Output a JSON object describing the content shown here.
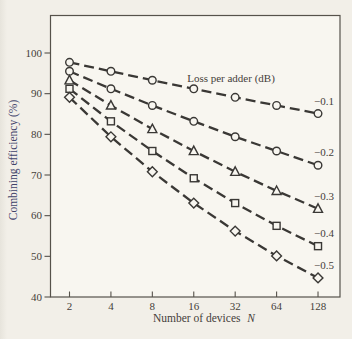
{
  "figure": {
    "bg_color": "#f2efe8",
    "plot_bg_color": "#f8f6f0",
    "axis_color": "#56524b",
    "line_color": "#3a3835",
    "text_color": "#45403a",
    "ylabel_color": "#3f436b"
  },
  "chart_data": {
    "type": "line",
    "title": "",
    "legend_title": "Loss per adder (dB)",
    "xlabel": "Number of devices N",
    "xlabel_text": "Number of devices",
    "xlabel_var": "N",
    "ylabel": "Combining efficiency (%)",
    "x_scale": "log2",
    "x": [
      2,
      4,
      8,
      16,
      32,
      64,
      128
    ],
    "xtick_labels": [
      "2",
      "4",
      "8",
      "16",
      "32",
      "64",
      "128"
    ],
    "ylim": [
      40,
      100
    ],
    "yticks": [
      40,
      50,
      60,
      70,
      80,
      90,
      100
    ],
    "grid": false,
    "line_style": "dashed",
    "legend_position": "inside-top-center",
    "series_labels_position": "right-of-last-point",
    "series": [
      {
        "name": "−0.1",
        "marker": "circle",
        "values": [
          97.7,
          95.5,
          93.3,
          91.2,
          89.1,
          87.1,
          85.1
        ]
      },
      {
        "name": "−0.2",
        "marker": "circle",
        "values": [
          95.5,
          91.2,
          87.1,
          83.2,
          79.4,
          75.9,
          72.4
        ]
      },
      {
        "name": "−0.3",
        "marker": "triangle",
        "values": [
          93.3,
          87.1,
          81.3,
          75.9,
          70.8,
          66.1,
          61.7
        ]
      },
      {
        "name": "−0.4",
        "marker": "square",
        "values": [
          91.2,
          83.2,
          75.9,
          69.2,
          63.1,
          57.5,
          52.5
        ]
      },
      {
        "name": "−0.5",
        "marker": "diamond",
        "values": [
          89.1,
          79.4,
          70.8,
          63.1,
          56.2,
          50.1,
          44.7
        ]
      }
    ]
  }
}
